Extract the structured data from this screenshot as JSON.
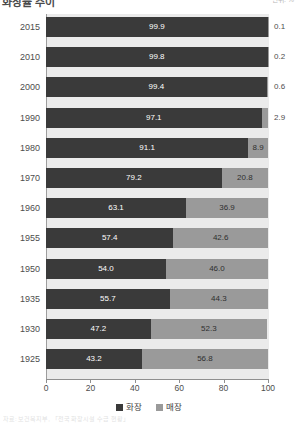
{
  "header": {
    "title_fragment": "화장률 추이",
    "corner_note": "단위: %"
  },
  "footnote": "자료: 보건복지부, 「전국 화장시설 수급 현황」",
  "legend": {
    "position": "bottom-center",
    "items": [
      {
        "label": "화장",
        "color": "#3a3a3a",
        "name": "series-cremation"
      },
      {
        "label": "매장",
        "color": "#9a9a9a",
        "name": "series-burial"
      }
    ]
  },
  "axis": {
    "x_ticks": [
      "0",
      "20",
      "40",
      "60",
      "80",
      "100"
    ]
  },
  "chart_data": {
    "type": "bar",
    "orientation": "horizontal",
    "stacked": true,
    "normalized_percent": true,
    "title": "화장률 추이",
    "xlabel": "",
    "ylabel": "",
    "xlim": [
      0,
      100
    ],
    "grid": false,
    "categories": [
      "2015",
      "2010",
      "2000",
      "1990",
      "1980",
      "1970",
      "1960",
      "1955",
      "1950",
      "1935",
      "1930",
      "1925"
    ],
    "series": [
      {
        "name": "화장",
        "color": "#3a3a3a",
        "values": [
          99.9,
          99.8,
          99.4,
          97.1,
          91.1,
          79.2,
          63.1,
          57.4,
          54.0,
          55.7,
          47.2,
          43.2
        ]
      },
      {
        "name": "매장",
        "color": "#9a9a9a",
        "values": [
          0.1,
          0.2,
          0.6,
          2.9,
          8.9,
          20.8,
          36.9,
          42.6,
          46.0,
          44.3,
          52.3,
          56.8
        ]
      }
    ],
    "rows": [
      {
        "category": "2015",
        "a": 99.9,
        "b": 0.1,
        "a_label": "99.9",
        "b_label": "0.1",
        "b_outside": true
      },
      {
        "category": "2010",
        "a": 99.8,
        "b": 0.2,
        "a_label": "99.8",
        "b_label": "0.2",
        "b_outside": true
      },
      {
        "category": "2000",
        "a": 99.4,
        "b": 0.6,
        "a_label": "99.4",
        "b_label": "0.6",
        "b_outside": true
      },
      {
        "category": "1990",
        "a": 97.1,
        "b": 2.9,
        "a_label": "97.1",
        "b_label": "2.9",
        "b_outside": true
      },
      {
        "category": "1980",
        "a": 91.1,
        "b": 8.9,
        "a_label": "91.1",
        "b_label": "8.9",
        "b_outside": false
      },
      {
        "category": "1970",
        "a": 79.2,
        "b": 20.8,
        "a_label": "79.2",
        "b_label": "20.8",
        "b_outside": false
      },
      {
        "category": "1960",
        "a": 63.1,
        "b": 36.9,
        "a_label": "63.1",
        "b_label": "36.9",
        "b_outside": false
      },
      {
        "category": "1955",
        "a": 57.4,
        "b": 42.6,
        "a_label": "57.4",
        "b_label": "42.6",
        "b_outside": false
      },
      {
        "category": "1950",
        "a": 54.0,
        "b": 46.0,
        "a_label": "54.0",
        "b_label": "46.0",
        "b_outside": false
      },
      {
        "category": "1935",
        "a": 55.7,
        "b": 44.3,
        "a_label": "55.7",
        "b_label": "44.3",
        "b_outside": false
      },
      {
        "category": "1930",
        "a": 47.2,
        "b": 52.3,
        "a_label": "47.2",
        "b_label": "52.3",
        "b_outside": false
      },
      {
        "category": "1925",
        "a": 43.2,
        "b": 56.8,
        "a_label": "43.2",
        "b_label": "56.8",
        "b_outside": false
      }
    ]
  }
}
